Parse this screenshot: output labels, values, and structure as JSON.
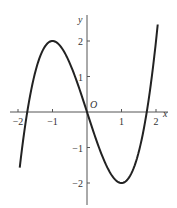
{
  "chart_data": {
    "type": "line",
    "title": "",
    "function": "y = x^3 - 3x",
    "xlabel": "x",
    "ylabel": "y",
    "origin_label": "O",
    "xlim": [
      -2.05,
      2.15
    ],
    "ylim": [
      -2.6,
      2.8
    ],
    "x_ticks": [
      -2,
      -1,
      1,
      2
    ],
    "x_tick_labels": [
      "−2",
      "−1",
      "1",
      "2"
    ],
    "y_ticks": [
      2,
      1,
      -1,
      -2
    ],
    "y_tick_labels": [
      "2",
      "1",
      "−1",
      "−2"
    ],
    "grid": false,
    "legend": null,
    "series": [
      {
        "name": "curve",
        "x": [
          -1.95,
          -1.732,
          -1.5,
          -1.0,
          -0.5,
          0,
          0.5,
          1.0,
          1.5,
          1.732,
          2.05
        ],
        "y": [
          -1.56,
          0,
          1.125,
          2,
          1.375,
          0,
          -1.375,
          -2,
          -1.125,
          0,
          2.46
        ]
      }
    ],
    "key_points": {
      "local_max": [
        -1,
        2
      ],
      "local_min": [
        1,
        -2
      ],
      "x_intercepts": [
        -1.732,
        0,
        1.732
      ]
    },
    "color": "#222222"
  }
}
